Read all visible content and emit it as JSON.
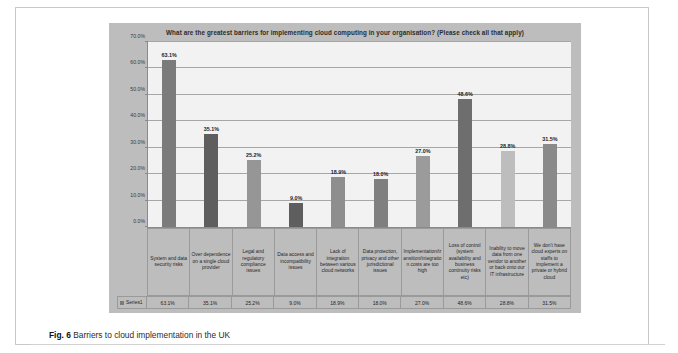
{
  "figure": {
    "label": "Fig. 6",
    "caption": "Barriers to cloud implementation in the UK"
  },
  "chart_data": {
    "type": "bar",
    "title": "What are the greatest barriers for implementing cloud computing in your organisation? (Please check all that apply)",
    "xlabel": "",
    "ylabel": "",
    "ylim": [
      0,
      70
    ],
    "grid": true,
    "legend_position": "bottom-table",
    "ytick_labels": [
      "0.0%",
      "10.0%",
      "20.0%",
      "30.0%",
      "40.0%",
      "50.0%",
      "60.0%",
      "70.0%"
    ],
    "ytick_values": [
      0,
      10,
      20,
      30,
      40,
      50,
      60,
      70
    ],
    "categories": [
      "System and data security risks",
      "Over dependence on a single cloud provider",
      "Legal and regulatory compliance issues",
      "Data access and incompatibility issues",
      "Lack of integration between various cloud networks",
      "Data protection, privacy and other jurisdictional issues",
      "Implementation/transition/integration costs are too high",
      "Loss of control (system availability and business continuity risks etc)",
      "Inability to move data from one vendor to another or back onto our IT infrastructure",
      "We don't have cloud experts on staffs to implement a private or hybrid cloud"
    ],
    "series": [
      {
        "name": "Series1",
        "values": [
          63.1,
          35.1,
          25.2,
          9.0,
          18.9,
          18.0,
          27.0,
          48.6,
          28.8,
          31.5
        ],
        "value_labels": [
          "63.1%",
          "35.1%",
          "25.2%",
          "9.0%",
          "18.9%",
          "18.0%",
          "27.0%",
          "48.6%",
          "28.8%",
          "31.5%"
        ],
        "bar_colors": [
          "#7b7b7b",
          "#5e5e5e",
          "#969696",
          "#5e5e5e",
          "#8e8e8e",
          "#7f7f7f",
          "#9b9b9b",
          "#6e6e6e",
          "#bdbdbd",
          "#8a8a8a"
        ]
      }
    ]
  },
  "colors": {
    "chart_background": "#bdbdbd",
    "plot_background": "#f2f2f2",
    "gridline": "#a6a6a6",
    "axis": "#8a8a8a",
    "page_background": "#ffffff"
  }
}
